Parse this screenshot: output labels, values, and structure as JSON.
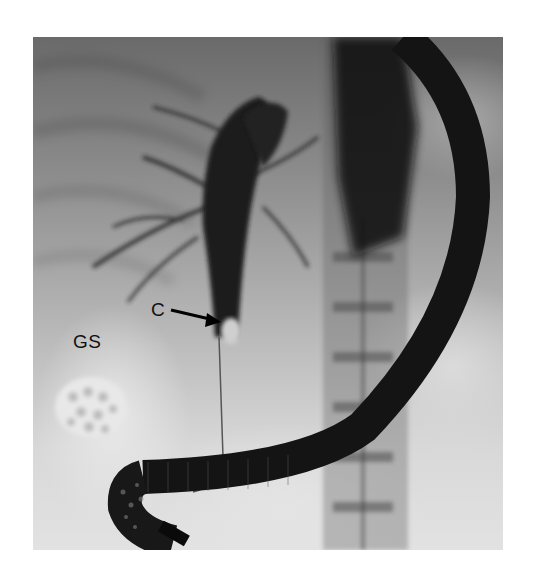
{
  "figure": {
    "type": "fluoroscopic radiograph",
    "labels": {
      "c": "C",
      "gs": "GS"
    },
    "annotations": [
      {
        "label": "C",
        "pointer": "arrow pointing right-down to filling defect in common bile duct"
      },
      {
        "label": "GS",
        "pointer": "none (labels calcified gallstone cluster below)"
      }
    ],
    "colors": {
      "background": "#ffffff",
      "scope": "#1a1a1a",
      "duct_contrast": "#2a2a2a",
      "label_text": "#111111"
    }
  }
}
